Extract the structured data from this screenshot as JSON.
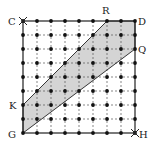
{
  "figure": {
    "grid": {
      "cols": 9,
      "rows": 9,
      "origin_x": 23,
      "origin_y": 21,
      "spacing": 14
    },
    "colors": {
      "shade": "#d4d4d4",
      "line": "#222222",
      "dot": "#111111",
      "dash": "#555555"
    },
    "labels": {
      "C": "C",
      "D": "D",
      "G": "G",
      "H": "H",
      "K": "K",
      "Q": "Q",
      "R": "R"
    },
    "shaded_polygon": [
      {
        "name": "K",
        "col": 0,
        "row": 6
      },
      {
        "name": "R",
        "col": 6,
        "row": 0
      },
      {
        "name": "D",
        "col": 8,
        "row": 0
      },
      {
        "name": "Q",
        "col": 8,
        "row": 2
      },
      {
        "name": "G",
        "col": 0,
        "row": 8
      }
    ],
    "crossed_corners": [
      "C",
      "H"
    ]
  }
}
